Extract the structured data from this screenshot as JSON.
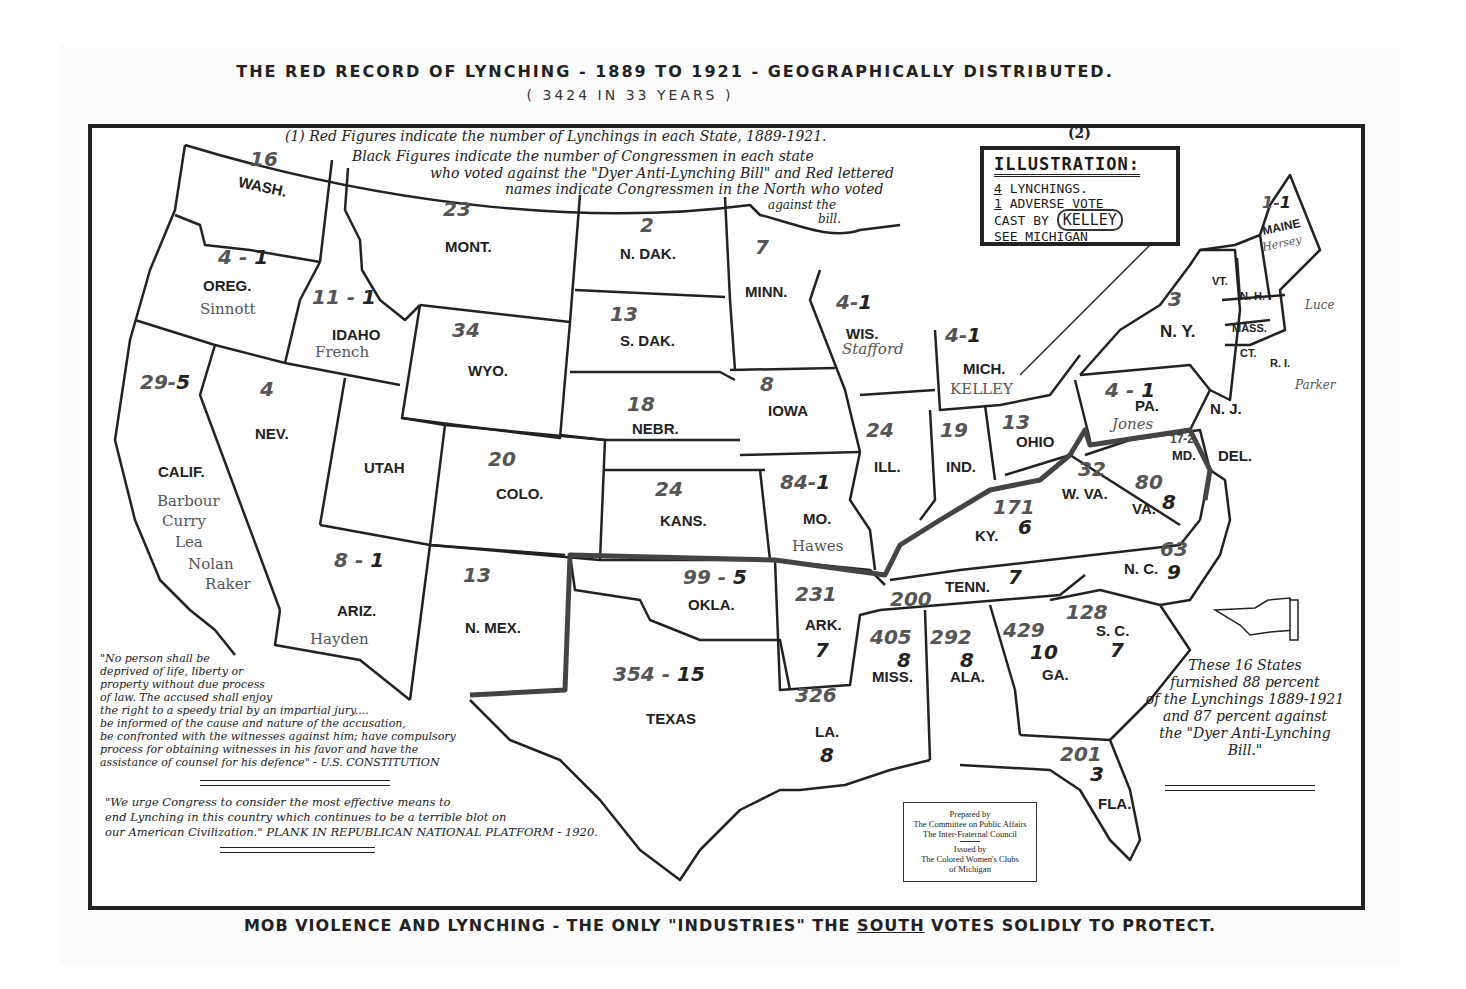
{
  "header": {
    "title": "THE RED RECORD OF LYNCHING - 1889 TO 1921 - GEOGRAPHICALLY DISTRIBUTED.",
    "subtitle": "( 3424 IN 33 YEARS )"
  },
  "legend_note": {
    "marker": "(1)",
    "line1": "Red Figures indicate the number of Lynchings in each State, 1889-1921.",
    "line2": "Black Figures indicate the number of Congressmen in each state",
    "line3": "who voted against the \"Dyer Anti-Lynching Bill\" and Red lettered",
    "line4": "names indicate Congressmen in the North who voted",
    "line5": "against the",
    "line6": "bill."
  },
  "illustration_box": {
    "marker": "(2)",
    "heading": "ILLUSTRATION:",
    "row1_num": "4",
    "row1_text": "LYNCHINGS.",
    "row2_num": "1",
    "row2_text": "ADVERSE VOTE",
    "row3_text": "CAST BY",
    "row3_name": "KELLEY",
    "row4_text": "SEE MICHIGAN"
  },
  "states": [
    {
      "abbr": "WASH.",
      "lynchings": "16",
      "votes": "",
      "names": []
    },
    {
      "abbr": "OREG.",
      "lynchings": "4",
      "votes": "1",
      "names": [
        "Sinnott"
      ]
    },
    {
      "abbr": "IDAHO",
      "lynchings": "11",
      "votes": "1",
      "names": [
        "French"
      ]
    },
    {
      "abbr": "CALIF.",
      "lynchings": "29",
      "votes": "5",
      "names": [
        "Barbour",
        "Curry",
        "Lea",
        "Nolan",
        "Raker"
      ]
    },
    {
      "abbr": "NEV.",
      "lynchings": "4",
      "votes": "",
      "names": []
    },
    {
      "abbr": "MONT.",
      "lynchings": "23",
      "votes": "",
      "names": []
    },
    {
      "abbr": "WYO.",
      "lynchings": "34",
      "votes": "",
      "names": []
    },
    {
      "abbr": "UTAH",
      "lynchings": "",
      "votes": "",
      "names": []
    },
    {
      "abbr": "COLO.",
      "lynchings": "20",
      "votes": "",
      "names": []
    },
    {
      "abbr": "ARIZ.",
      "lynchings": "8",
      "votes": "1",
      "names": [
        "Hayden"
      ]
    },
    {
      "abbr": "N. MEX.",
      "lynchings": "13",
      "votes": "",
      "names": []
    },
    {
      "abbr": "N. DAK.",
      "lynchings": "2",
      "votes": "",
      "names": []
    },
    {
      "abbr": "S. DAK.",
      "lynchings": "13",
      "votes": "",
      "names": []
    },
    {
      "abbr": "NEBR.",
      "lynchings": "18",
      "votes": "",
      "names": []
    },
    {
      "abbr": "KANS.",
      "lynchings": "24",
      "votes": "",
      "names": []
    },
    {
      "abbr": "OKLA.",
      "lynchings": "99",
      "votes": "5",
      "names": []
    },
    {
      "abbr": "TEXAS",
      "lynchings": "354",
      "votes": "15",
      "names": []
    },
    {
      "abbr": "MINN.",
      "lynchings": "7",
      "votes": "",
      "names": []
    },
    {
      "abbr": "IOWA",
      "lynchings": "8",
      "votes": "",
      "names": []
    },
    {
      "abbr": "MO.",
      "lynchings": "84",
      "votes": "1",
      "names": [
        "Hawes"
      ]
    },
    {
      "abbr": "ARK.",
      "lynchings": "231",
      "votes": "7",
      "names": []
    },
    {
      "abbr": "LA.",
      "lynchings": "326",
      "votes": "8",
      "names": []
    },
    {
      "abbr": "WIS.",
      "lynchings": "4",
      "votes": "1",
      "names": [
        "Stafford"
      ]
    },
    {
      "abbr": "MICH.",
      "lynchings": "4",
      "votes": "1",
      "names": [
        "KELLEY"
      ]
    },
    {
      "abbr": "ILL.",
      "lynchings": "24",
      "votes": "",
      "names": []
    },
    {
      "abbr": "IND.",
      "lynchings": "19",
      "votes": "",
      "names": []
    },
    {
      "abbr": "OHIO",
      "lynchings": "13",
      "votes": "",
      "names": []
    },
    {
      "abbr": "KY.",
      "lynchings": "171",
      "votes": "6",
      "names": []
    },
    {
      "abbr": "TENN.",
      "lynchings": "200",
      "votes": "7",
      "names": []
    },
    {
      "abbr": "MISS.",
      "lynchings": "405",
      "votes": "8",
      "names": []
    },
    {
      "abbr": "ALA.",
      "lynchings": "292",
      "votes": "8",
      "names": []
    },
    {
      "abbr": "GA.",
      "lynchings": "429",
      "votes": "10",
      "names": []
    },
    {
      "abbr": "FLA.",
      "lynchings": "201",
      "votes": "3",
      "names": []
    },
    {
      "abbr": "S. C.",
      "lynchings": "128",
      "votes": "7",
      "names": []
    },
    {
      "abbr": "N. C.",
      "lynchings": "63",
      "votes": "9",
      "names": []
    },
    {
      "abbr": "VA.",
      "lynchings": "80",
      "votes": "8",
      "names": []
    },
    {
      "abbr": "W. VA.",
      "lynchings": "32",
      "votes": "",
      "names": []
    },
    {
      "abbr": "MD.",
      "lynchings": "17",
      "votes": "2",
      "names": []
    },
    {
      "abbr": "DEL.",
      "lynchings": "1",
      "votes": "",
      "names": []
    },
    {
      "abbr": "PA.",
      "lynchings": "4",
      "votes": "1",
      "names": [
        "Jones"
      ]
    },
    {
      "abbr": "N. J.",
      "lynchings": "1",
      "votes": "1",
      "names": [
        "Parker"
      ]
    },
    {
      "abbr": "N. Y.",
      "lynchings": "3",
      "votes": "",
      "names": []
    },
    {
      "abbr": "VT.",
      "lynchings": "",
      "votes": "",
      "names": []
    },
    {
      "abbr": "N. H.",
      "lynchings": "",
      "votes": "",
      "names": []
    },
    {
      "abbr": "MASS.",
      "lynchings": "",
      "votes": "",
      "names": [
        "Luce"
      ]
    },
    {
      "abbr": "CT.",
      "lynchings": "",
      "votes": "",
      "names": []
    },
    {
      "abbr": "R. I.",
      "lynchings": "",
      "votes": "",
      "names": []
    },
    {
      "abbr": "MAINE",
      "lynchings": "1",
      "votes": "1",
      "names": [
        "Hersey"
      ]
    }
  ],
  "stats_note": {
    "line1": "These 16 States",
    "line2": "furnished 88 percent",
    "line3": "of the Lynchings 1889-1921",
    "line4": "and 87 percent against",
    "line5": "the \"Dyer Anti-Lynching",
    "line6": "Bill.\""
  },
  "constitution_quote": {
    "l1": "\"No person shall be",
    "l2": "deprived of life, liberty or",
    "l3": "property without due process",
    "l4": "of law. The accused shall enjoy",
    "l5": "the right to a speedy trial by an impartial jury....",
    "l6": "be informed of the cause and nature of the accusation,",
    "l7": "be confronted with the witnesses against him; have compulsory",
    "l8": "process for obtaining witnesses in his favor and have the",
    "l9": "assistance of counsel for his defence\" - U.S. CONSTITUTION"
  },
  "platform_quote": {
    "l1": "\"We urge Congress to consider the most effective means to",
    "l2": "end Lynching in this country which continues to be a terrible blot on",
    "l3": "our American Civilization.\" PLANK IN REPUBLICAN NATIONAL PLATFORM - 1920."
  },
  "credits": {
    "l1": "Prepared by",
    "l2": "The Committee on Public Affairs",
    "l3": "The Inter-Fraternal Council",
    "l4": "Issued by",
    "l5": "The Colored Women's Clubs",
    "l6": "of Michigan"
  },
  "footer": {
    "pre": "MOB VIOLENCE AND LYNCHING - THE ONLY \"INDUSTRIES\" THE ",
    "emph": "SOUTH",
    "post": " VOTES SOLIDLY TO PROTECT."
  }
}
